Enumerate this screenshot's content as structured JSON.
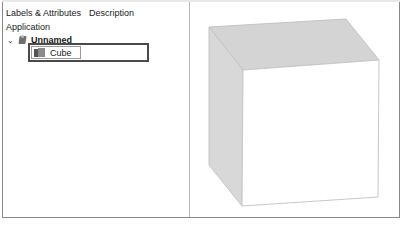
{
  "tabs": [
    {
      "label": "Labels & Attributes"
    },
    {
      "label": "Description"
    }
  ],
  "tree": {
    "root_label": "Application",
    "document": {
      "label": "Unnamed",
      "expanded": true,
      "icon": "document-icon"
    },
    "selected_item": {
      "label": "Cube",
      "icon": "cube-icon"
    }
  },
  "viewport": {
    "object": "Cube",
    "colors": {
      "top_face": "#d4d4d4",
      "side_face": "#d8d8d8",
      "front_face": "#ffffff",
      "edge": "#c4c4c4"
    }
  }
}
